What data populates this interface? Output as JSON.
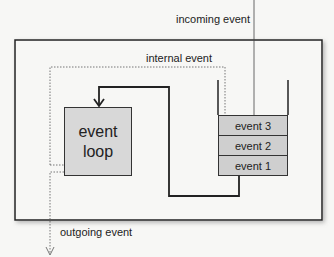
{
  "diagram": {
    "labels": {
      "incoming_event": "incoming event",
      "internal_event": "internal event",
      "outgoing_event": "outgoing event",
      "event_loop_line1": "event",
      "event_loop_line2": "loop"
    },
    "queue": {
      "items": [
        "event 3",
        "event 2",
        "event 1"
      ]
    },
    "colors": {
      "box_fill": "#d8d8d8",
      "queue_fill": "#cfcfcf",
      "stroke": "#333333",
      "background": "#f7f7f5"
    }
  }
}
